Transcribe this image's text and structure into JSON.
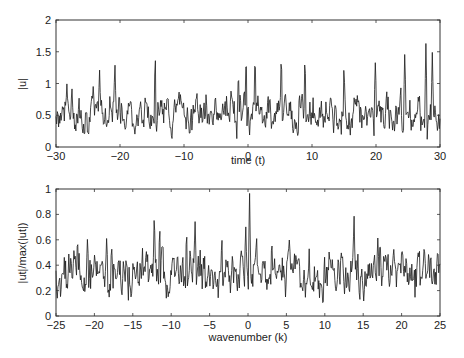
{
  "chart_data": [
    {
      "type": "line",
      "title": "",
      "xlabel": "time (t)",
      "ylabel": "|u|",
      "xlim": [
        -30,
        30
      ],
      "ylim": [
        0,
        2
      ],
      "xticks": [
        -30,
        -20,
        -10,
        0,
        10,
        20,
        30
      ],
      "yticks": [
        0,
        0.5,
        1,
        1.5,
        2
      ],
      "ytick_labels": [
        "0",
        "0.5",
        "1",
        "1.5",
        "2"
      ],
      "grid": false,
      "legend": null,
      "series": [
        {
          "name": "|u|",
          "description": "noisy signal, mean ~0.55, range ~0.05–1.65",
          "n_points": 600,
          "baseline": 0.55,
          "spread": 0.32,
          "seed": 7,
          "peaks": [
            {
              "x": -14.5,
              "y": 1.48
            },
            {
              "x": -20.8,
              "y": 1.35
            },
            {
              "x": -23.2,
              "y": 1.25
            },
            {
              "x": -28.3,
              "y": 1.0
            },
            {
              "x": -1.5,
              "y": 1.2
            },
            {
              "x": -0.3,
              "y": 1.5
            },
            {
              "x": 1.1,
              "y": 1.5
            },
            {
              "x": 5.2,
              "y": 1.5
            },
            {
              "x": 8.9,
              "y": 1.45
            },
            {
              "x": 15.0,
              "y": 1.3
            },
            {
              "x": 19.9,
              "y": 1.4
            },
            {
              "x": 24.5,
              "y": 1.5
            },
            {
              "x": 27.8,
              "y": 1.65
            },
            {
              "x": 28.8,
              "y": 1.5
            }
          ]
        }
      ]
    },
    {
      "type": "line",
      "title": "",
      "xlabel": "wavenumber (k)",
      "ylabel": "|ut|/max(|ut|)",
      "xlim": [
        -25,
        25
      ],
      "ylim": [
        0,
        1
      ],
      "xticks": [
        -25,
        -20,
        -15,
        -10,
        -5,
        0,
        5,
        10,
        15,
        20,
        25
      ],
      "yticks": [
        0,
        0.2,
        0.4,
        0.6,
        0.8,
        1
      ],
      "ytick_labels": [
        "0",
        "0.2",
        "0.4",
        "0.6",
        "0.8",
        "1"
      ],
      "grid": false,
      "legend": null,
      "series": [
        {
          "name": "|ut|/max(|ut|)",
          "description": "normalized spectrum, mean ~0.33, peak 1.0 at k≈0.2",
          "n_points": 600,
          "baseline": 0.33,
          "spread": 0.2,
          "seed": 13,
          "peaks": [
            {
              "x": 0.2,
              "y": 1.0
            },
            {
              "x": -0.3,
              "y": 0.72
            },
            {
              "x": -12.2,
              "y": 0.84
            },
            {
              "x": -11.5,
              "y": 0.72
            },
            {
              "x": -6.9,
              "y": 0.78
            },
            {
              "x": -8.0,
              "y": 0.68
            },
            {
              "x": -3.4,
              "y": 0.63
            },
            {
              "x": 13.8,
              "y": 0.83
            },
            {
              "x": 16.9,
              "y": 0.62
            },
            {
              "x": -22.2,
              "y": 0.63
            },
            {
              "x": -20.9,
              "y": 0.62
            },
            {
              "x": -18.4,
              "y": 0.62
            },
            {
              "x": 3.1,
              "y": 0.6
            }
          ]
        }
      ]
    }
  ],
  "plots": {
    "top": {
      "xlabel": "time (t)",
      "ylabel": "|u|"
    },
    "bottom": {
      "xlabel": "wavenumber (k)",
      "ylabel": "|ut|/max(|ut|)"
    }
  },
  "colors": {
    "line": "#1a1a1a",
    "axes": "#333333",
    "background": "#ffffff"
  }
}
